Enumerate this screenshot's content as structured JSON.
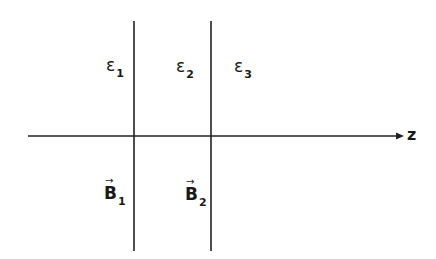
{
  "diagram": {
    "type": "layered-media-boundaries",
    "axis": {
      "label": "z",
      "direction": "right"
    },
    "boundaries": [
      {
        "index": 1
      },
      {
        "index": 2
      }
    ],
    "regions": [
      {
        "permittivity_symbol": "ε",
        "permittivity_sub": "1",
        "field_symbol": "B",
        "field_sub": "1",
        "field_vector_arrow": "→"
      },
      {
        "permittivity_symbol": "ε",
        "permittivity_sub": "2",
        "field_symbol": "B",
        "field_sub": "2",
        "field_vector_arrow": "→"
      },
      {
        "permittivity_symbol": "ε",
        "permittivity_sub": "3"
      }
    ],
    "colors": {
      "line": "#222222",
      "text": "#1a1a1a",
      "background": "#ffffff"
    }
  }
}
